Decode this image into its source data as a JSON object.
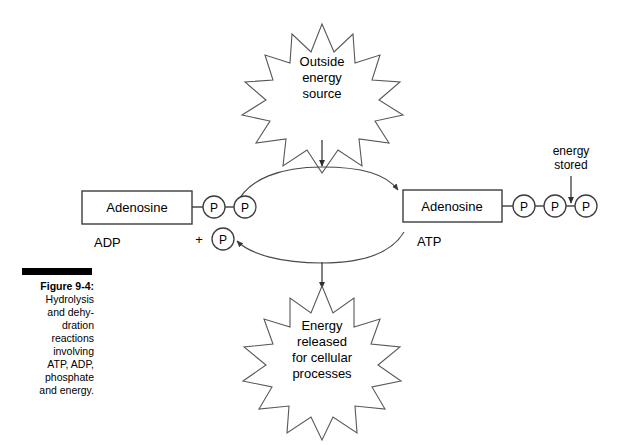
{
  "figure": {
    "caption_title": "Figure 9-4:",
    "caption_body": "Hydrolysis\nand dehy-\ndration\nreactions\ninvolving\nATP, ADP,\nphosphate\nand energy.",
    "rule_color": "#000000"
  },
  "diagram": {
    "background": "#ffffff",
    "line_color": "#3d3d3f",
    "burst_line_color": "#58585a",
    "top_burst": {
      "lines": [
        "Outside",
        "energy",
        "source"
      ],
      "points": 12
    },
    "bottom_burst": {
      "lines": [
        "Energy",
        "released",
        "for cellular",
        "processes"
      ],
      "points": 13
    },
    "left_molecule": {
      "box_label": "Adenosine",
      "name": "ADP",
      "phosphates": [
        "P",
        "P"
      ],
      "free_phosphate": "P",
      "plus_sign": "+"
    },
    "right_molecule": {
      "box_label": "Adenosine",
      "name": "ATP",
      "phosphates": [
        "P",
        "P",
        "P"
      ]
    },
    "energy_stored_label": {
      "lines": [
        "energy",
        "stored"
      ]
    },
    "arrows": {
      "top_into_cycle": "downward-arrow",
      "bottom_out_of_cycle": "downward-arrow",
      "upper_cycle": "adp-to-atp-arrow",
      "lower_cycle": "atp-to-adp-arrow",
      "energy_stored": "downward-arrow"
    }
  }
}
